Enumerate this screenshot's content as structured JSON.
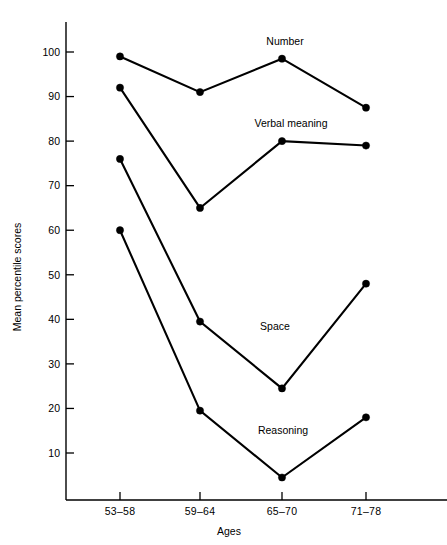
{
  "chart_data": {
    "type": "line",
    "title": "",
    "xlabel": "Ages",
    "ylabel": "Mean percentile scores",
    "categories": [
      "53–58",
      "59–64",
      "65–70",
      "71–78"
    ],
    "ylim": [
      0,
      105
    ],
    "yticks": [
      10,
      20,
      30,
      40,
      50,
      60,
      70,
      80,
      90,
      100
    ],
    "ytick_labels": [
      "10",
      "20",
      "30",
      "40",
      "50",
      "60",
      "70",
      "80",
      "90",
      "100"
    ],
    "grid": false,
    "legend_position": "inline-annotations",
    "marker": "filled-circle",
    "line_color": "#000000",
    "series": [
      {
        "name": "Number",
        "values": [
          99,
          91,
          98.5,
          87.5
        ]
      },
      {
        "name": "Verbal meaning",
        "values": [
          92,
          65,
          80,
          79
        ]
      },
      {
        "name": "Space",
        "values": [
          76,
          39.5,
          24.5,
          48
        ]
      },
      {
        "name": "Reasoning",
        "values": [
          60,
          19.5,
          4.5,
          18
        ]
      }
    ],
    "annotations": [
      {
        "text": "Number",
        "series": "Number",
        "x": 285,
        "y": 45
      },
      {
        "text": "Verbal meaning",
        "series": "Verbal meaning",
        "x": 291,
        "y": 127
      },
      {
        "text": "Space",
        "series": "Space",
        "x": 275,
        "y": 330
      },
      {
        "text": "Reasoning",
        "series": "Reasoning",
        "x": 283,
        "y": 434
      }
    ]
  },
  "axes": {
    "x_title": "Ages",
    "y_title": "Mean percentile scores"
  }
}
